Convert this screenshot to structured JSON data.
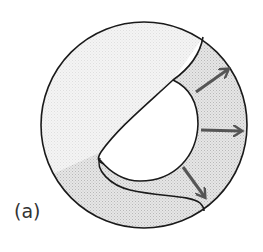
{
  "figure": {
    "panel_label": "(a)",
    "colors": {
      "outline": "#1a1a1a",
      "shaded_fill": "#dcdcdc",
      "inner_fill": "#ffffff",
      "arrow": "#555555"
    },
    "elements": {
      "outer_circle": "outer-circle",
      "inner_region": "white-crescent-region",
      "arrows": [
        "arrow-up-right",
        "arrow-right",
        "arrow-down-right"
      ]
    }
  }
}
